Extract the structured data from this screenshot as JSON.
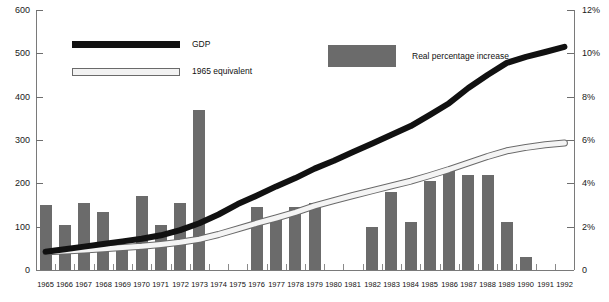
{
  "chart_data": {
    "type": "bar",
    "title": "",
    "subtitle": "",
    "xlabel": "",
    "ylabel": "",
    "grid": false,
    "legend_position": "top",
    "categories": [
      "1965",
      "1966",
      "1967",
      "1968",
      "1969",
      "1970",
      "1971",
      "1972",
      "1973",
      "1974",
      "1975",
      "1976",
      "1977",
      "1978",
      "1979",
      "1980",
      "1981",
      "1982",
      "1983",
      "1984",
      "1985",
      "1986",
      "1987",
      "1988",
      "1989",
      "1990",
      "1991",
      "1992"
    ],
    "left_axis": {
      "label": "",
      "ticks": [
        "0",
        "100",
        "200",
        "300",
        "400",
        "500",
        "600"
      ],
      "tick_values": [
        0,
        100,
        200,
        300,
        400,
        500,
        600
      ],
      "ylim": [
        0,
        600
      ]
    },
    "right_axis": {
      "label": "",
      "ticks": [
        "0",
        "2%",
        "4%",
        "6%",
        "8%",
        "10%",
        "12%"
      ],
      "tick_values": [
        0,
        2,
        4,
        6,
        8,
        10,
        12
      ],
      "ylim": [
        0,
        12
      ]
    },
    "series": [
      {
        "name": "Real percentage increase",
        "type": "bar",
        "axis": "right",
        "color": "#6b6b6b",
        "values": [
          3.0,
          2.1,
          3.1,
          2.7,
          1.2,
          3.4,
          2.1,
          3.1,
          7.4,
          null,
          null,
          2.9,
          2.3,
          2.9,
          3.1,
          null,
          null,
          2.0,
          3.6,
          2.2,
          4.1,
          4.6,
          4.4,
          4.4,
          2.2,
          0.6,
          null,
          null
        ]
      },
      {
        "name": "GDP",
        "type": "line",
        "axis": "left",
        "color": "#111111",
        "values": [
          42,
          48,
          54,
          60,
          66,
          72,
          80,
          92,
          108,
          128,
          152,
          172,
          193,
          212,
          234,
          252,
          272,
          292,
          312,
          332,
          358,
          385,
          420,
          450,
          478,
          492,
          503,
          515
        ]
      },
      {
        "name": "1965 equivalent",
        "type": "line",
        "axis": "left",
        "color": "#f4f4f4",
        "values": [
          42,
          44,
          46,
          49,
          52,
          55,
          59,
          64,
          71,
          82,
          95,
          108,
          120,
          133,
          148,
          160,
          172,
          183,
          194,
          205,
          218,
          232,
          247,
          262,
          275,
          283,
          289,
          293
        ]
      }
    ],
    "legend": [
      {
        "label": "GDP",
        "swatch": "thick-black-line"
      },
      {
        "label": "1965 equivalent",
        "swatch": "thin-white-line"
      },
      {
        "label": "Real percentage increase",
        "swatch": "gray-rect"
      }
    ],
    "colors": {
      "bar": "#6b6b6b",
      "gdp_line": "#111111",
      "equiv_line": "#f4f4f4",
      "equiv_line_edge": "#6a6a6a",
      "axis": "#7a7a7a",
      "text": "#111111",
      "background": "#ffffff"
    }
  }
}
